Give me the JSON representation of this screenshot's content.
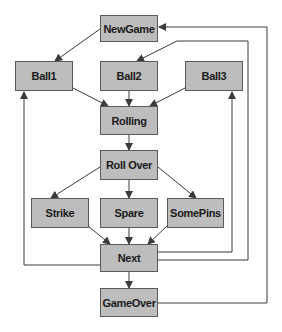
{
  "diagram": {
    "type": "state-machine",
    "colors": {
      "node_fill": "#bdbdbd",
      "node_border": "#5a5a5a",
      "edge": "#3a3a3a"
    },
    "nodes": {
      "newgame": "NewGame",
      "ball1": "Ball1",
      "ball2": "Ball2",
      "ball3": "Ball3",
      "rolling": "Rolling",
      "rollover": "Roll Over",
      "strike": "Strike",
      "spare": "Spare",
      "somepins": "SomePins",
      "next": "Next",
      "gameover": "GameOver"
    },
    "edges": [
      [
        "NewGame",
        "Ball1"
      ],
      [
        "Ball1",
        "Rolling"
      ],
      [
        "Ball2",
        "Rolling"
      ],
      [
        "Ball3",
        "Rolling"
      ],
      [
        "Rolling",
        "Roll Over"
      ],
      [
        "Roll Over",
        "Strike"
      ],
      [
        "Roll Over",
        "Spare"
      ],
      [
        "Roll Over",
        "SomePins"
      ],
      [
        "Strike",
        "Next"
      ],
      [
        "Spare",
        "Next"
      ],
      [
        "SomePins",
        "Next"
      ],
      [
        "Next",
        "Ball1"
      ],
      [
        "Next",
        "Ball2"
      ],
      [
        "Next",
        "Ball3"
      ],
      [
        "Next",
        "GameOver"
      ],
      [
        "GameOver",
        "NewGame"
      ]
    ]
  }
}
